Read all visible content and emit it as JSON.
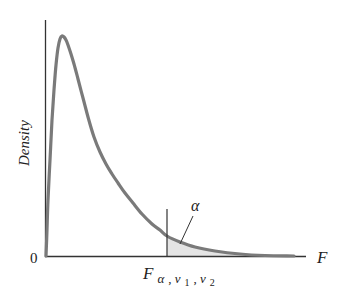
{
  "chart_data": {
    "type": "area",
    "title": "",
    "xlabel": "F",
    "ylabel": "Density",
    "origin_label": "0",
    "distribution": "F distribution probability density",
    "critical_value_label": {
      "base": "F",
      "subscript": "α, v1, v2",
      "sub_parts": [
        "α",
        ", ",
        "v",
        "1",
        ", ",
        "v",
        "2"
      ]
    },
    "shaded_region_label": "α",
    "shaded_region": "right tail beyond critical value",
    "grid": false,
    "legend": null,
    "curve_pixels": [
      [
        46,
        256
      ],
      [
        47,
        230
      ],
      [
        48,
        200
      ],
      [
        50,
        160
      ],
      [
        52,
        120
      ],
      [
        54,
        90
      ],
      [
        56,
        65
      ],
      [
        58,
        48
      ],
      [
        60,
        39
      ],
      [
        62,
        36
      ],
      [
        64,
        37
      ],
      [
        66,
        40
      ],
      [
        68,
        45
      ],
      [
        71,
        54
      ],
      [
        74,
        64
      ],
      [
        78,
        79
      ],
      [
        83,
        98
      ],
      [
        88,
        117
      ],
      [
        94,
        137
      ],
      [
        100,
        152
      ],
      [
        106,
        164
      ],
      [
        112,
        174
      ],
      [
        118,
        183
      ],
      [
        125,
        193
      ],
      [
        133,
        203
      ],
      [
        142,
        214
      ],
      [
        152,
        224
      ],
      [
        160,
        230
      ],
      [
        167,
        236
      ],
      [
        180,
        242
      ],
      [
        195,
        247
      ],
      [
        215,
        251
      ],
      [
        240,
        254
      ],
      [
        265,
        255.5
      ],
      [
        294,
        256
      ]
    ],
    "critical_x_pixel": 167
  },
  "colors": {
    "curve": "#7a7a7a",
    "axis": "#333333",
    "shade": "#e4e4e4",
    "text": "#222222"
  }
}
